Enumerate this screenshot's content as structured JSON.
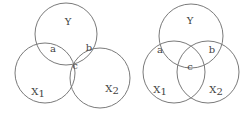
{
  "diagrams": [
    {
      "name": "venn-left",
      "circles": [
        {
          "id": "Y",
          "cx": 66,
          "cy": 34,
          "r": 31
        },
        {
          "id": "X1",
          "cx": 45,
          "cy": 73,
          "r": 30
        },
        {
          "id": "X2",
          "cx": 100,
          "cy": 78,
          "r": 30
        }
      ],
      "labels": {
        "Y": "Y",
        "a": "a",
        "b": "b",
        "c": "c",
        "X1": "X",
        "X1_sub": "1",
        "X2": "X",
        "X2_sub": "2"
      }
    },
    {
      "name": "venn-right",
      "circles": [
        {
          "id": "Y",
          "cx": 191,
          "cy": 36,
          "r": 32
        },
        {
          "id": "X1",
          "cx": 174,
          "cy": 72,
          "r": 31
        },
        {
          "id": "X2",
          "cx": 208,
          "cy": 72,
          "r": 31
        }
      ],
      "labels": {
        "Y": "Y",
        "a": "a",
        "b": "b",
        "c": "c",
        "X1": "X",
        "X1_sub": "1",
        "X2": "X",
        "X2_sub": "2"
      }
    }
  ],
  "colors": {
    "stroke": "#7a7a7a",
    "text": "#444444",
    "background": "#ffffff"
  }
}
